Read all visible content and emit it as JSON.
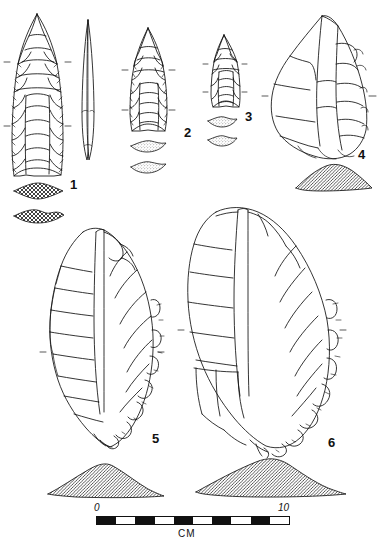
{
  "plate": {
    "title": "Lithic artifact plate",
    "background_color": "#ffffff",
    "ink_color": "#111111",
    "width": 382,
    "height": 543
  },
  "figures": [
    {
      "id": "figure-1",
      "label": "1",
      "label_x": 70,
      "label_y": 178,
      "artifact": "fluted-projectile-point",
      "description": "Large fluted lanceolate point, face view with flute scar",
      "cross_sections": 2,
      "cross_section_fill": "crosshatch",
      "side_view": "narrow lenticular profile"
    },
    {
      "id": "figure-2",
      "label": "2",
      "label_x": 184,
      "label_y": 126,
      "artifact": "fluted-projectile-point",
      "description": "Medium fluted point, basal fragment",
      "cross_sections": 2,
      "cross_section_fill": "stipple"
    },
    {
      "id": "figure-3",
      "label": "3",
      "label_x": 245,
      "label_y": 110,
      "artifact": "fluted-projectile-point",
      "description": "Small fluted point fragment",
      "cross_sections": 2,
      "cross_section_fill": "stipple"
    },
    {
      "id": "figure-4",
      "label": "4",
      "label_x": 358,
      "label_y": 148,
      "artifact": "retouched-flake-scraper",
      "description": "Large retouched flake / core scraper",
      "cross_sections": 1,
      "cross_section_fill": "diagonal-hatch"
    },
    {
      "id": "figure-5",
      "label": "5",
      "label_x": 152,
      "label_y": 432,
      "artifact": "unifacial-biface",
      "description": "Large teardrop biface with steep retouched edge",
      "cross_sections": 1,
      "cross_section_fill": "diagonal-hatch"
    },
    {
      "id": "figure-6",
      "label": "6",
      "label_x": 328,
      "label_y": 436,
      "artifact": "unifacial-biface",
      "description": "Large ovate biface with steep retouched lateral edge",
      "cross_sections": 1,
      "cross_section_fill": "diagonal-hatch"
    }
  ],
  "scale": {
    "start_label": "0",
    "end_label": "10",
    "unit_label": "CM",
    "segments": 10,
    "segment_pattern": [
      "on",
      "off",
      "on",
      "off",
      "on",
      "off",
      "on",
      "off",
      "on",
      "off"
    ],
    "start_label_x": 94,
    "start_label_y": 503,
    "end_label_x": 278,
    "end_label_y": 503,
    "unit_label_x": 178,
    "unit_label_y": 529
  }
}
